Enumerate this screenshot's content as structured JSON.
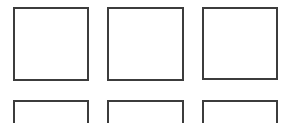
{
  "grid": {
    "border_color": "#3c3c3c",
    "background": "#ffffff",
    "boxes": [
      {
        "row": 1,
        "col": 1,
        "x": 13,
        "y": 7,
        "w": 76,
        "h": 74
      },
      {
        "row": 1,
        "col": 2,
        "x": 107,
        "y": 7,
        "w": 77,
        "h": 74
      },
      {
        "row": 1,
        "col": 3,
        "x": 202,
        "y": 7,
        "w": 76,
        "h": 73
      },
      {
        "row": 2,
        "col": 1,
        "x": 13,
        "y": 100,
        "w": 76,
        "h": 30
      },
      {
        "row": 2,
        "col": 2,
        "x": 107,
        "y": 100,
        "w": 77,
        "h": 30
      },
      {
        "row": 2,
        "col": 3,
        "x": 202,
        "y": 100,
        "w": 76,
        "h": 30
      }
    ]
  }
}
